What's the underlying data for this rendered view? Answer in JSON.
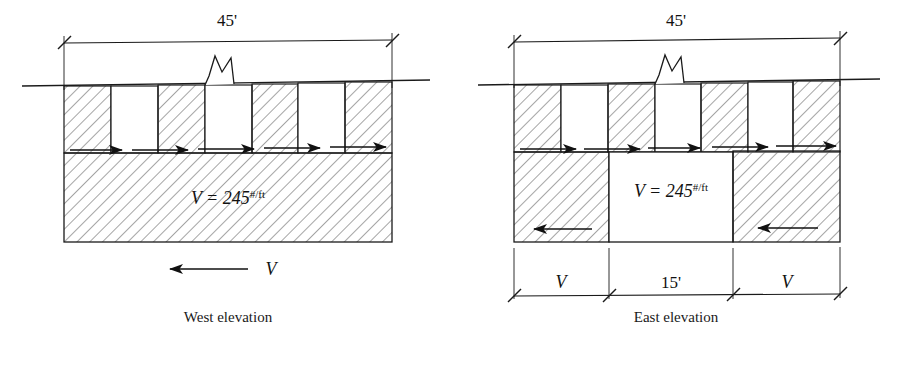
{
  "figure": {
    "background": "#ffffff",
    "line_color": "#1a1a1a",
    "hatch_color": "#5a5a5a"
  },
  "west": {
    "caption": "West elevation",
    "top_dimension": "45'",
    "load_label_prefix": "V = 245",
    "load_label_superscript": "#/ft",
    "reaction_label": "V",
    "panel_count": 7,
    "panel_fill_pattern": [
      "hatched",
      "blank",
      "hatched",
      "blank",
      "hatched",
      "blank",
      "hatched"
    ],
    "upper_arrow_count": 5,
    "upper_arrow_direction": "right",
    "reaction_arrow_direction": "left",
    "break_symbol": "zigzag-break"
  },
  "east": {
    "caption": "East elevation",
    "top_dimension": "45'",
    "load_label_prefix": "V = 245",
    "load_label_superscript": "#/ft",
    "bottom_dimensions": [
      "V",
      "15'",
      "V"
    ],
    "panel_count": 7,
    "panel_fill_pattern": [
      "hatched",
      "blank",
      "hatched",
      "blank",
      "hatched",
      "blank",
      "hatched"
    ],
    "upper_arrow_count": 5,
    "upper_arrow_direction": "right",
    "lower_arrow_count": 2,
    "lower_arrow_direction": "left",
    "lower_fill_pattern": [
      "hatched",
      "blank",
      "hatched"
    ],
    "break_symbol": "zigzag-break"
  }
}
